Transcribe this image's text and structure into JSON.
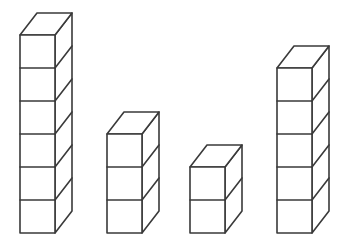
{
  "figure": {
    "kind": "unit-cube-bar-graph",
    "background_color": "#ffffff",
    "line_color": "#3a3a3a",
    "face_color": "#ffffff",
    "line_width": 1.6,
    "geometry": {
      "cube_width": 35,
      "cube_height": 33,
      "depth_dx": 17,
      "depth_dy": -22,
      "baseline_y": 233
    },
    "towers": [
      {
        "name": "tower-1",
        "cubes": 6,
        "front_left_x": 20
      },
      {
        "name": "tower-2",
        "cubes": 3,
        "front_left_x": 107
      },
      {
        "name": "tower-3",
        "cubes": 2,
        "front_left_x": 190
      },
      {
        "name": "tower-4",
        "cubes": 5,
        "front_left_x": 277
      }
    ]
  },
  "chart_data": {
    "type": "bar",
    "title": "",
    "subtitle": "",
    "xlabel": "",
    "ylabel": "",
    "categories": [
      "1",
      "2",
      "3",
      "4"
    ],
    "values": [
      6,
      3,
      2,
      5
    ],
    "unit": "cubes",
    "ylim": [
      0,
      6
    ],
    "grid": false,
    "legend": null,
    "tick_labels_x": [],
    "tick_labels_y": [],
    "annotations": []
  }
}
